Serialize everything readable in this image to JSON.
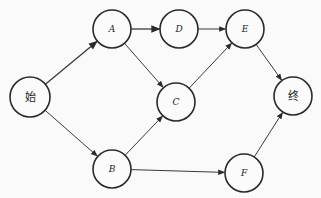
{
  "diagram": {
    "type": "directed-network",
    "nodes": [
      {
        "id": "start",
        "label": "始",
        "x": 30,
        "y": 97,
        "r": 20,
        "script": "cjk"
      },
      {
        "id": "A",
        "label": "A",
        "x": 112,
        "y": 29,
        "r": 19,
        "script": "latin"
      },
      {
        "id": "D",
        "label": "D",
        "x": 179,
        "y": 29,
        "r": 19,
        "script": "latin"
      },
      {
        "id": "E",
        "label": "E",
        "x": 245,
        "y": 29,
        "r": 19,
        "script": "latin"
      },
      {
        "id": "C",
        "label": "C",
        "x": 176,
        "y": 102,
        "r": 19,
        "script": "latin"
      },
      {
        "id": "B",
        "label": "B",
        "x": 112,
        "y": 169,
        "r": 19,
        "script": "latin"
      },
      {
        "id": "F",
        "label": "F",
        "x": 244,
        "y": 173,
        "r": 19,
        "script": "latin"
      },
      {
        "id": "end",
        "label": "终",
        "x": 293,
        "y": 96,
        "r": 19,
        "script": "cjk"
      }
    ],
    "edges": [
      {
        "from": "start",
        "to": "A",
        "bold": true
      },
      {
        "from": "start",
        "to": "B",
        "bold": false
      },
      {
        "from": "A",
        "to": "D",
        "bold": true
      },
      {
        "from": "A",
        "to": "C",
        "bold": false
      },
      {
        "from": "D",
        "to": "E",
        "bold": false
      },
      {
        "from": "C",
        "to": "E",
        "bold": false
      },
      {
        "from": "B",
        "to": "C",
        "bold": false
      },
      {
        "from": "B",
        "to": "F",
        "bold": false
      },
      {
        "from": "E",
        "to": "end",
        "bold": false
      },
      {
        "from": "F",
        "to": "end",
        "bold": false
      }
    ],
    "colors": {
      "stroke": "#2a2a2a",
      "background": "#fafafa"
    }
  }
}
